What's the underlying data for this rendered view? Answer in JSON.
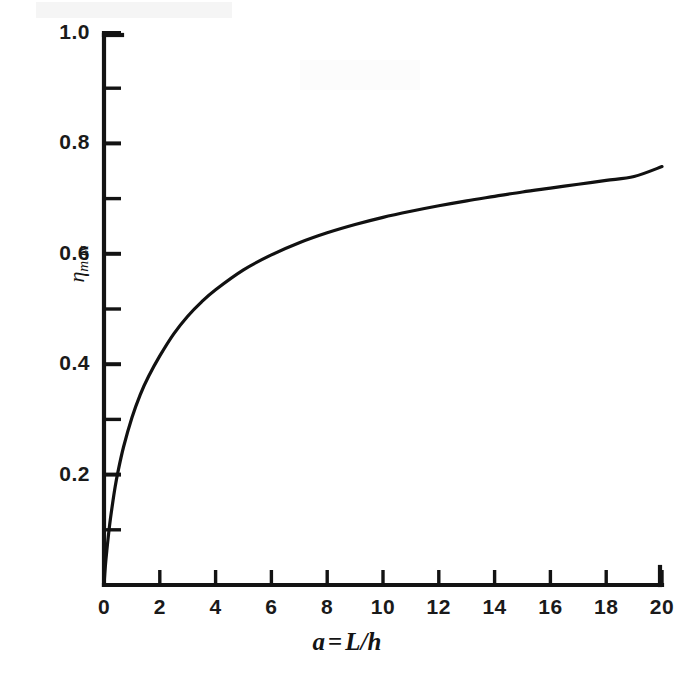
{
  "chart_data": {
    "type": "line",
    "title": "",
    "subtitle": "",
    "xlabel": "a = L/h",
    "ylabel": "ηmax",
    "xlabel_parts": {
      "lhs": "a",
      "op": "=",
      "rhs": "L/h"
    },
    "ylabel_parts": {
      "symbol": "η",
      "subscript": "max"
    },
    "xlim": [
      0,
      20
    ],
    "ylim": [
      0,
      1.0
    ],
    "grid": false,
    "legend": null,
    "x_major_ticks": [
      0,
      2,
      4,
      6,
      8,
      10,
      12,
      14,
      16,
      18,
      20
    ],
    "x_tick_labels": [
      "0",
      "2",
      "4",
      "6",
      "8",
      "10",
      "12",
      "14",
      "16",
      "18",
      "20"
    ],
    "y_major_ticks": [
      0.2,
      0.4,
      0.6,
      0.8,
      1.0
    ],
    "y_tick_labels": [
      "0.2",
      "0.4",
      "0.6",
      "0.8",
      "1.0"
    ],
    "y_minor_ticks": [
      0.1,
      0.3,
      0.5,
      0.7,
      0.9
    ],
    "tick_direction": "in",
    "axes_visible": [
      "left",
      "bottom"
    ],
    "line_color": "#111111",
    "line_width": 3.2,
    "series": [
      {
        "name": "eta_max",
        "x": [
          0,
          0.05,
          0.1,
          0.2,
          0.3,
          0.4,
          0.5,
          0.7,
          1.0,
          1.3,
          1.6,
          2.0,
          2.5,
          3.0,
          3.5,
          4.0,
          5.0,
          6.0,
          7.0,
          8.0,
          9.0,
          10.0,
          11.0,
          12.0,
          13.0,
          14.0,
          15.0,
          16.0,
          17.0,
          18.0,
          19.0,
          20.0
        ],
        "values": [
          0.0,
          0.035,
          0.062,
          0.108,
          0.145,
          0.178,
          0.205,
          0.25,
          0.303,
          0.345,
          0.378,
          0.415,
          0.455,
          0.487,
          0.513,
          0.535,
          0.571,
          0.598,
          0.62,
          0.638,
          0.653,
          0.666,
          0.677,
          0.687,
          0.696,
          0.704,
          0.712,
          0.719,
          0.726,
          0.733,
          0.74,
          0.758
        ]
      }
    ]
  },
  "figure": {
    "background_color": "#ffffff",
    "plot_left_px": 104,
    "plot_right_px": 662,
    "plot_top_px": 33,
    "plot_bottom_px": 585
  }
}
